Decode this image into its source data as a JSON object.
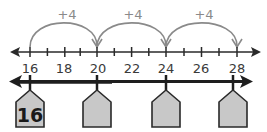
{
  "diagram": {
    "type": "number-line-skip-counting",
    "top_number_line": {
      "min": 16,
      "max": 28,
      "step": 1,
      "labeled_ticks": [
        "16",
        "18",
        "20",
        "22",
        "24",
        "26",
        "28"
      ],
      "jumps": [
        {
          "from": 16,
          "to": 20,
          "label": "+4"
        },
        {
          "from": 20,
          "to": 24,
          "label": "+4"
        },
        {
          "from": 24,
          "to": 28,
          "label": "+4"
        }
      ]
    },
    "bottom_number_line": {
      "houses": [
        {
          "position": 16,
          "label": "16"
        },
        {
          "position": 20,
          "label": ""
        },
        {
          "position": 24,
          "label": ""
        },
        {
          "position": 28,
          "label": ""
        }
      ]
    },
    "colors": {
      "line": "#2a2a2a",
      "arc": "#8a8a8a",
      "house_fill": "#c8c8c8",
      "house_stroke": "#2a2a2a"
    }
  }
}
